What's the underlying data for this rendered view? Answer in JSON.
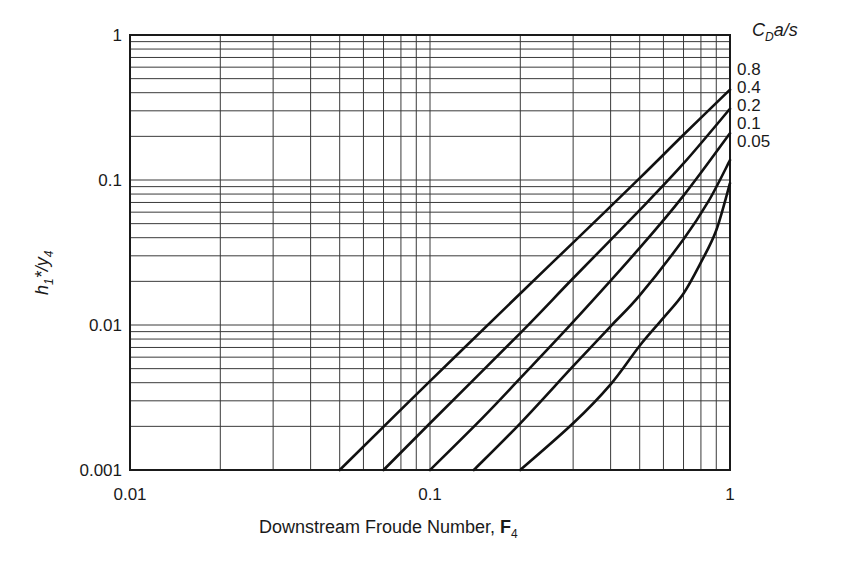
{
  "chart_data": {
    "type": "line",
    "title": "",
    "xlabel": "Downstream Froude Number, F4",
    "ylabel": "h1*/y4",
    "xscale": "log",
    "yscale": "log",
    "xlim": [
      0.01,
      1
    ],
    "ylim": [
      0.001,
      1
    ],
    "grid": true,
    "x_tick_labels": [
      "0.01",
      "0.1",
      "1"
    ],
    "y_tick_labels": [
      "0.001",
      "0.01",
      "0.1",
      "1"
    ],
    "legend_title": "CDa/s",
    "legend_position": "right, outside plot near curve ends",
    "series": [
      {
        "name": "0.8",
        "x": [
          0.05,
          0.1,
          0.2,
          0.3,
          0.5,
          0.7,
          1.0
        ],
        "y": [
          0.001,
          0.0041,
          0.0165,
          0.037,
          0.103,
          0.205,
          0.42
        ]
      },
      {
        "name": "0.4",
        "x": [
          0.07,
          0.1,
          0.2,
          0.3,
          0.5,
          0.7,
          1.0
        ],
        "y": [
          0.001,
          0.0021,
          0.0088,
          0.021,
          0.062,
          0.13,
          0.31
        ]
      },
      {
        "name": "0.2",
        "x": [
          0.1,
          0.15,
          0.2,
          0.3,
          0.5,
          0.7,
          1.0
        ],
        "y": [
          0.001,
          0.0023,
          0.0043,
          0.0105,
          0.034,
          0.078,
          0.21
        ]
      },
      {
        "name": "0.1",
        "x": [
          0.14,
          0.2,
          0.3,
          0.4,
          0.5,
          0.7,
          0.85,
          1.0
        ],
        "y": [
          0.001,
          0.0021,
          0.0052,
          0.0098,
          0.016,
          0.039,
          0.072,
          0.137
        ]
      },
      {
        "name": "0.05",
        "x": [
          0.2,
          0.3,
          0.4,
          0.5,
          0.6,
          0.7,
          0.8,
          0.9,
          1.0
        ],
        "y": [
          0.001,
          0.0021,
          0.0039,
          0.0072,
          0.0112,
          0.0165,
          0.027,
          0.045,
          0.095
        ]
      }
    ]
  },
  "axes": {
    "x_label_text": "Downstream Froude Number, ",
    "x_label_bold": "F",
    "x_label_sub": "4",
    "y_label_main": "h",
    "y_label_sub1": "1",
    "y_label_mid": "*/y",
    "y_label_sub2": "4"
  },
  "legend": {
    "title_main": "C",
    "title_sub": "D",
    "title_rest": "a/s"
  }
}
